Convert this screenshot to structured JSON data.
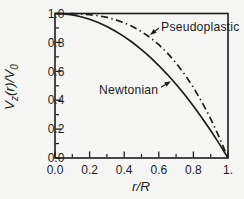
{
  "figure": {
    "background": "#f5f5f3",
    "ink": "#1d1d1d"
  },
  "chart_data": {
    "type": "line",
    "title": "",
    "xlabel": "r/R",
    "ylabel": "Vz(r)/V0",
    "xlim": [
      0,
      1
    ],
    "ylim": [
      0,
      1
    ],
    "grid": false,
    "legend_position": "none (inline text annotations with arrows)",
    "frame": "full box, ticks inward on left and bottom axes only",
    "x_major_ticks": {
      "values": [
        0,
        0.2,
        0.4,
        0.6,
        0.8,
        1.0
      ],
      "labels": [
        "0.0",
        "0.2",
        "0.4",
        "0.6",
        "0.8",
        "1."
      ]
    },
    "y_major_ticks": {
      "values": [
        0,
        0.2,
        0.4,
        0.6,
        0.8,
        1.0
      ],
      "labels": [
        "0.0",
        "0.2",
        "0.4",
        "0.6",
        "0.8",
        "1.0"
      ]
    },
    "x_minor_ticks": [
      0.1,
      0.3,
      0.5,
      0.7,
      0.9
    ],
    "y_minor_ticks": [
      0.1,
      0.3,
      0.5,
      0.7,
      0.9
    ],
    "x": [
      0,
      0.05,
      0.1,
      0.15,
      0.2,
      0.25,
      0.3,
      0.35,
      0.4,
      0.45,
      0.5,
      0.55,
      0.6,
      0.65,
      0.7,
      0.75,
      0.8,
      0.85,
      0.9,
      0.95,
      1
    ],
    "series": [
      {
        "name": "Newtonian",
        "line_style": "solid",
        "relation": "1 - (r/R)^2",
        "values": [
          1,
          0.9975,
          0.99,
          0.9775,
          0.96,
          0.9375,
          0.91,
          0.8775,
          0.84,
          0.7975,
          0.75,
          0.6975,
          0.64,
          0.5775,
          0.51,
          0.4375,
          0.36,
          0.2775,
          0.19,
          0.0975,
          0
        ]
      },
      {
        "name": "Pseudoplastic",
        "line_style": "dash-dot",
        "relation": "1 - (r/R)^3",
        "values": [
          1,
          0.9999,
          0.999,
          0.9966,
          0.992,
          0.9844,
          0.973,
          0.9571,
          0.936,
          0.9089,
          0.875,
          0.8336,
          0.784,
          0.7254,
          0.657,
          0.5781,
          0.488,
          0.3859,
          0.271,
          0.1426,
          0
        ]
      }
    ],
    "annotations": [
      {
        "text": "Pseudoplastic",
        "label_anchor": "start",
        "label_x": 0.613,
        "label_y": 0.879,
        "arrow_from": [
          0.601,
          0.9
        ],
        "arrow_to": [
          0.549,
          0.852
        ]
      },
      {
        "text": "Newtonian",
        "label_anchor": "start",
        "label_x": 0.254,
        "label_y": 0.443,
        "arrow_from": [
          0.613,
          0.49
        ],
        "arrow_to": [
          0.67,
          0.531
        ]
      }
    ]
  },
  "y_axis": {
    "var": "V",
    "sub": "z",
    "rest": "(r)/V",
    "sub2": "0"
  },
  "x_axis": {
    "label": "r/R"
  }
}
